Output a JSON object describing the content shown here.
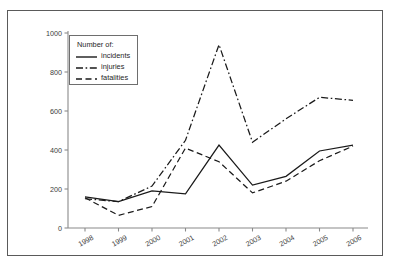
{
  "chart_data": {
    "type": "line",
    "title": "",
    "subtitle": "",
    "xlabel": "",
    "ylabel": "",
    "categories": [
      "1998",
      "1999",
      "2000",
      "2001",
      "2002",
      "2003",
      "2004",
      "2005",
      "2006"
    ],
    "x": [
      1998,
      1999,
      2000,
      2001,
      2002,
      2003,
      2004,
      2005,
      2006
    ],
    "xlim": [
      1998,
      2006
    ],
    "ylim": [
      0,
      1000
    ],
    "yticks": [
      0,
      200,
      400,
      600,
      800,
      1000
    ],
    "ytick_labels": [
      "0",
      "200",
      "400",
      "600",
      "800",
      "1000"
    ],
    "xticks": [
      1998,
      1999,
      2000,
      2001,
      2002,
      2003,
      2004,
      2005,
      2006
    ],
    "xtick_labels": [
      "1998",
      "1999",
      "2000",
      "2001",
      "2002",
      "2003",
      "2004",
      "2005",
      "2006"
    ],
    "grid": false,
    "legend_position": "upper-left",
    "legend_title": "Number of:",
    "series": [
      {
        "name": "incidents",
        "style": "solid",
        "color": "#1a1a1a",
        "values": [
          160,
          135,
          190,
          175,
          425,
          220,
          265,
          395,
          425
        ]
      },
      {
        "name": "injuries",
        "style": "dash-dot",
        "color": "#1a1a1a",
        "values": [
          150,
          135,
          215,
          450,
          940,
          440,
          560,
          670,
          655
        ]
      },
      {
        "name": "fatalities",
        "style": "dashed",
        "color": "#1a1a1a",
        "values": [
          155,
          65,
          110,
          410,
          340,
          180,
          240,
          345,
          420
        ]
      }
    ]
  },
  "legend": {
    "title": "Number of:",
    "items": [
      {
        "label": "incidents",
        "style": "solid"
      },
      {
        "label": "injuries",
        "style": "dash-dot"
      },
      {
        "label": "fatalities",
        "style": "dashed"
      }
    ]
  },
  "axes": {
    "y_tick_labels": [
      "1000",
      "800",
      "600",
      "400",
      "200",
      "0"
    ],
    "x_tick_labels": [
      "1998",
      "1999",
      "2000",
      "2001",
      "2002",
      "2003",
      "2004",
      "2005",
      "2006"
    ]
  },
  "colors": {
    "frame": "#5a5a5a",
    "axis": "#8a8a8a",
    "line": "#1a1a1a",
    "text": "#3b3b3b",
    "background": "#ffffff"
  }
}
